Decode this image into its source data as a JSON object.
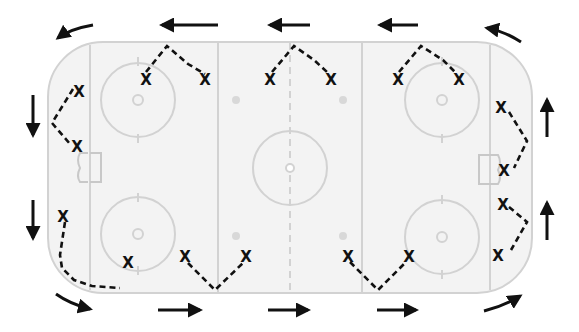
{
  "diagram": {
    "type": "hockey-rink-drill",
    "colors": {
      "ice": "#f3f3f3",
      "rink_lines": "#cfcfcf",
      "paths": "#111111",
      "arrows": "#111111"
    },
    "rink": {
      "x": 48,
      "y": 42,
      "width": 484,
      "height": 251,
      "corner_radius": 55
    },
    "player_symbol": "X",
    "players": [
      {
        "id": "p1",
        "label": "X",
        "x": 146,
        "y": 80
      },
      {
        "id": "p2",
        "label": "X",
        "x": 205,
        "y": 80
      },
      {
        "id": "p3",
        "label": "X",
        "x": 270,
        "y": 80
      },
      {
        "id": "p4",
        "label": "X",
        "x": 331,
        "y": 80
      },
      {
        "id": "p5",
        "label": "X",
        "x": 398,
        "y": 80
      },
      {
        "id": "p6",
        "label": "X",
        "x": 459,
        "y": 80
      },
      {
        "id": "p7",
        "label": "X",
        "x": 79,
        "y": 92
      },
      {
        "id": "p8",
        "label": "X",
        "x": 77,
        "y": 147
      },
      {
        "id": "p9",
        "label": "X",
        "x": 63,
        "y": 217
      },
      {
        "id": "p10",
        "label": "X",
        "x": 128,
        "y": 263
      },
      {
        "id": "p11",
        "label": "X",
        "x": 185,
        "y": 257
      },
      {
        "id": "p12",
        "label": "X",
        "x": 246,
        "y": 257
      },
      {
        "id": "p13",
        "label": "X",
        "x": 348,
        "y": 257
      },
      {
        "id": "p14",
        "label": "X",
        "x": 409,
        "y": 257
      },
      {
        "id": "p15",
        "label": "X",
        "x": 501,
        "y": 108
      },
      {
        "id": "p16",
        "label": "X",
        "x": 504,
        "y": 171
      },
      {
        "id": "p17",
        "label": "X",
        "x": 503,
        "y": 205
      },
      {
        "id": "p18",
        "label": "X",
        "x": 498,
        "y": 256
      }
    ],
    "paths": [
      {
        "id": "top-left-v",
        "points": "146,72 167,46 188,64 205,74"
      },
      {
        "id": "top-center-v",
        "points": "272,72 294,46 314,60 327,72"
      },
      {
        "id": "top-right-v",
        "points": "399,72 421,46 443,60 455,72"
      },
      {
        "id": "left-end-v",
        "points": "73,89 52,123 70,144"
      },
      {
        "id": "left-corner",
        "points": "65,222 60,255 62,268 74,280 92,286 120,288"
      },
      {
        "id": "bottom-left-v",
        "points": "188,263 215,290 243,263"
      },
      {
        "id": "bottom-right-v",
        "points": "350,262 378,290 406,262"
      },
      {
        "id": "right-end-top",
        "points": "509,112 527,141 514,168"
      },
      {
        "id": "right-end-bot",
        "points": "509,207 527,222 511,250"
      }
    ],
    "arrows": [
      {
        "id": "arrow-top-left-curve",
        "direction": "down-left",
        "d": "M93 25 Q70 29 58 38"
      },
      {
        "id": "arrow-top-1",
        "direction": "left",
        "x1": 218,
        "y1": 25,
        "x2": 162,
        "y2": 25
      },
      {
        "id": "arrow-top-2",
        "direction": "left",
        "x1": 310,
        "y1": 25,
        "x2": 270,
        "y2": 25
      },
      {
        "id": "arrow-top-3",
        "direction": "left",
        "x1": 418,
        "y1": 25,
        "x2": 380,
        "y2": 25
      },
      {
        "id": "arrow-top-right-curve",
        "direction": "up-left",
        "d": "M521 42 Q504 31 487 28"
      },
      {
        "id": "arrow-left-1",
        "direction": "down",
        "x1": 33,
        "y1": 95,
        "x2": 33,
        "y2": 135
      },
      {
        "id": "arrow-left-2",
        "direction": "down",
        "x1": 33,
        "y1": 200,
        "x2": 33,
        "y2": 238
      },
      {
        "id": "arrow-bottom-left-curve",
        "direction": "down-right",
        "d": "M56 294 Q70 304 90 309"
      },
      {
        "id": "arrow-bottom-1",
        "direction": "right",
        "x1": 158,
        "y1": 310,
        "x2": 200,
        "y2": 310
      },
      {
        "id": "arrow-bottom-2",
        "direction": "right",
        "x1": 268,
        "y1": 310,
        "x2": 308,
        "y2": 310
      },
      {
        "id": "arrow-bottom-3",
        "direction": "right",
        "x1": 377,
        "y1": 310,
        "x2": 416,
        "y2": 310
      },
      {
        "id": "arrow-bottom-right-curve",
        "direction": "up-right",
        "d": "M484 311 Q504 306 520 296"
      },
      {
        "id": "arrow-right-1",
        "direction": "up",
        "x1": 547,
        "y1": 137,
        "x2": 547,
        "y2": 100
      },
      {
        "id": "arrow-right-2",
        "direction": "up",
        "x1": 547,
        "y1": 240,
        "x2": 547,
        "y2": 203
      }
    ]
  }
}
